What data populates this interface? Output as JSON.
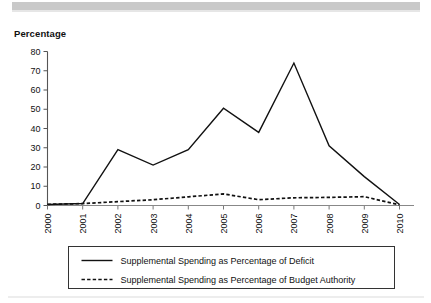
{
  "figure": {
    "y_axis_title": "Percentage",
    "band_color": "#c9c9c9",
    "line_color": "#111111",
    "background": "#ffffff"
  },
  "chart_data": {
    "type": "line",
    "title": "",
    "subtitle": "",
    "xlabel": "",
    "ylabel": "Percentage",
    "ylim": [
      0,
      80
    ],
    "ytick_values": [
      0,
      10,
      20,
      30,
      40,
      50,
      60,
      70,
      80
    ],
    "ytick_labels": [
      "0",
      "10",
      "20",
      "30",
      "40",
      "50",
      "60",
      "70",
      "80"
    ],
    "grid": false,
    "legend_position": "bottom",
    "categories": [
      "2000",
      "2001",
      "2002",
      "2003",
      "2004",
      "2005",
      "2006",
      "2007",
      "2008",
      "2009",
      "2010"
    ],
    "x": [
      2000,
      2001,
      2002,
      2003,
      2004,
      2005,
      2006,
      2007,
      2008,
      2009,
      2010
    ],
    "series": [
      {
        "name": "Supplemental Spending as Percentage of Deficit",
        "style": "solid",
        "color": "#111111",
        "values": [
          0.5,
          1.0,
          29.0,
          21.0,
          29.0,
          50.5,
          38.0,
          74.0,
          31.0,
          15.0,
          0.5
        ]
      },
      {
        "name": "Supplemental Spending as Percentage of Budget Authority",
        "style": "dashed",
        "color": "#111111",
        "values": [
          0.6,
          1.0,
          2.0,
          3.0,
          4.5,
          6.0,
          3.0,
          4.0,
          4.2,
          4.6,
          0.3
        ]
      }
    ]
  },
  "legend": {
    "entries": [
      {
        "label": "Supplemental Spending as Percentage of Deficit",
        "style": "solid"
      },
      {
        "label": "Supplemental Spending as Percentage of Budget Authority",
        "style": "dashed"
      }
    ]
  }
}
